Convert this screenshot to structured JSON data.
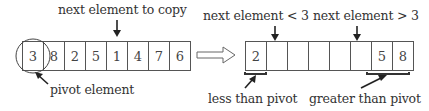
{
  "diagram": {
    "left_array": {
      "label_top": "next element to copy",
      "label_bottom": "pivot element",
      "cells": [
        "3",
        "8",
        "2",
        "5",
        "1",
        "4",
        "7",
        "6"
      ],
      "pivot_index": 0,
      "next_index": 4
    },
    "transition_arrow": "hollow-right-arrow",
    "right_array": {
      "label_top_left": "next element < 3",
      "label_top_right": "next element > 3",
      "label_bottom_left": "less than pivot",
      "label_bottom_right": "greater than pivot",
      "cells": [
        "2",
        "",
        "",
        "",
        "",
        "",
        "5",
        "8"
      ]
    },
    "colors": {
      "line": "#555555",
      "bracket": "#333333",
      "text": "#333333"
    }
  }
}
